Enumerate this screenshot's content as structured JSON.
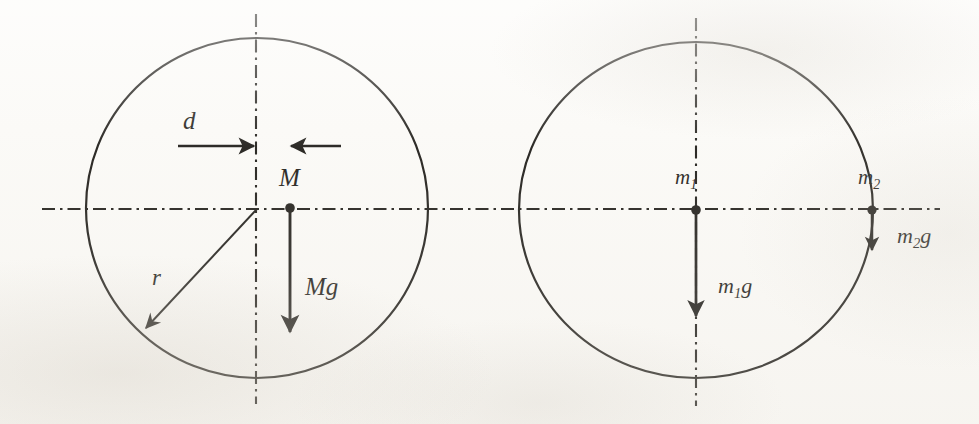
{
  "figure": {
    "kind": "free-body-diagram",
    "background_color": "#fbfaf7",
    "ink_color": "#15130f",
    "panels": [
      {
        "id": "left-panel",
        "name": "single-mass-disc",
        "circle": {
          "cx": 257,
          "cy": 208,
          "r": 171
        },
        "vertical_axis_x": 256,
        "horizontal_axis_y": 208,
        "center_dot": {
          "cx": 290,
          "cy": 208,
          "r": 4.5
        },
        "labels": {
          "offset": "d",
          "mass": "M",
          "weight": "Mg",
          "radius": "r"
        },
        "arrows": [
          {
            "name": "offset-arrow-right",
            "from": [
              178,
              146
            ],
            "to": [
              256,
              146
            ],
            "label": "d"
          },
          {
            "name": "offset-arrow-left",
            "from": [
              340,
              146
            ],
            "to": [
              290,
              146
            ],
            "label": ""
          },
          {
            "name": "weight-arrow",
            "from": [
              290,
              210
            ],
            "to": [
              290,
              338
            ],
            "label": "Mg"
          },
          {
            "name": "radius-arrow",
            "from": [
              257,
              209
            ],
            "to": [
              143,
              331
            ],
            "label": "r"
          }
        ]
      },
      {
        "id": "right-panel",
        "name": "two-mass-disc",
        "circle": {
          "cx": 696,
          "cy": 210,
          "r": 169
        },
        "vertical_axis_x": 696,
        "horizontal_axis_y": 210,
        "center_dot": {
          "cx": 696,
          "cy": 210,
          "r": 4.5
        },
        "rim_dot": {
          "cx": 872,
          "cy": 210,
          "r": 4.5
        },
        "labels": {
          "mass_1": "m",
          "mass_1_sub": "1",
          "mass_2": "m",
          "mass_2_sub": "2",
          "weight_1": "g",
          "weight_2": "g"
        },
        "arrows": [
          {
            "name": "weight-arrow-m1",
            "from": [
              696,
              212
            ],
            "to": [
              696,
              322
            ],
            "label": "m1g"
          },
          {
            "name": "weight-arrow-m2",
            "from": [
              872,
              212
            ],
            "to": [
              872,
              258
            ],
            "label": "m2g"
          }
        ]
      }
    ],
    "axes": {
      "horizontal": {
        "x_start": 42,
        "x_end": 940,
        "y": 209,
        "style": "dash-dot"
      },
      "vertical_left": {
        "x": 256,
        "y_start": 14,
        "y_end": 404,
        "style": "dash-dot"
      },
      "vertical_right": {
        "x": 696,
        "y_start": 18,
        "y_end": 406,
        "style": "dash-dot"
      }
    }
  },
  "labels": {
    "d": "d",
    "M": "M",
    "Mg": "Mg",
    "r": "r",
    "m1": "m",
    "m1_sub": "1",
    "m2": "m",
    "m2_sub": "2",
    "g": "g"
  }
}
